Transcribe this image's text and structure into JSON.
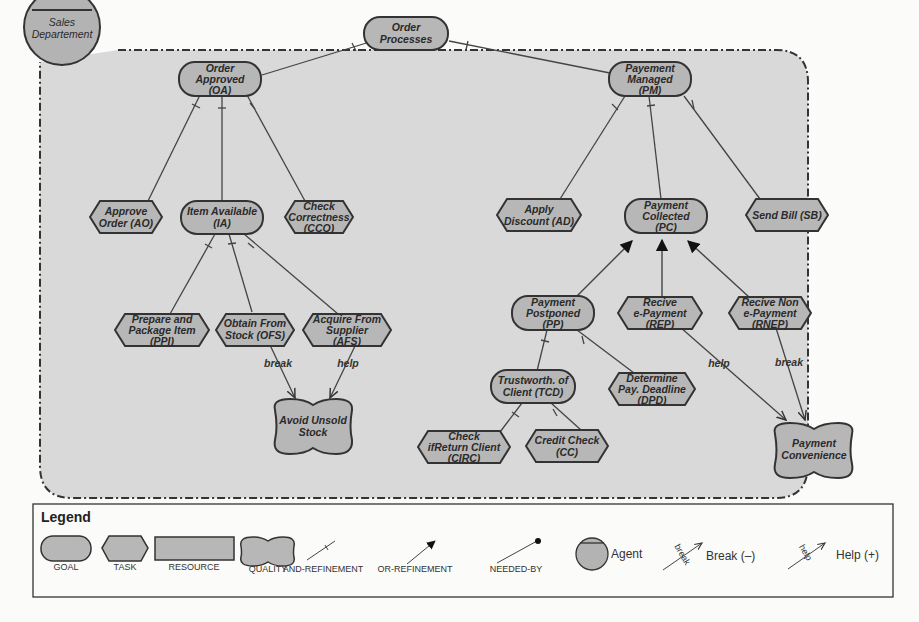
{
  "diagram": {
    "type": "iStar goal model",
    "agent": {
      "label_lines": [
        "Sales",
        "Departement"
      ]
    },
    "colors": {
      "node_fill": "#b7b7b7",
      "node_stroke": "#333333",
      "boundary_fill": "#d9d9d9",
      "background": "#fbfbfa"
    },
    "nodes": {
      "order_processes": {
        "type": "goal",
        "lines": [
          "Order",
          "Processes"
        ]
      },
      "oa": {
        "type": "goal",
        "lines": [
          "Order",
          "Approved",
          "(OA)"
        ]
      },
      "pm": {
        "type": "goal",
        "lines": [
          "Payement",
          "Managed",
          "(PM)"
        ]
      },
      "ao": {
        "type": "task",
        "lines": [
          "Approve",
          "Order (AO)"
        ]
      },
      "ia": {
        "type": "goal",
        "lines": [
          "Item Available",
          "(IA)"
        ]
      },
      "cco": {
        "type": "task",
        "lines": [
          "Check",
          "Correctness",
          "(CCO)"
        ]
      },
      "ad": {
        "type": "task",
        "lines": [
          "Apply",
          "Discount (AD)"
        ]
      },
      "pc": {
        "type": "goal",
        "lines": [
          "Payment",
          "Collected",
          "(PC)"
        ]
      },
      "sb": {
        "type": "task",
        "lines": [
          "Send Bill (SB)"
        ]
      },
      "ppi": {
        "type": "task",
        "lines": [
          "Prepare and",
          "Package Item",
          "(PPI)"
        ]
      },
      "ofs": {
        "type": "task",
        "lines": [
          "Obtain From",
          "Stock (OFS)"
        ]
      },
      "afs": {
        "type": "task",
        "lines": [
          "Acquire From",
          "Supplier",
          "(AFS)"
        ]
      },
      "aus": {
        "type": "quality",
        "lines": [
          "Avoid Unsold",
          "Stock"
        ]
      },
      "pp": {
        "type": "goal",
        "lines": [
          "Payment",
          "Postponed",
          "(PP)"
        ]
      },
      "rep": {
        "type": "task",
        "lines": [
          "Recive",
          "e-Payment",
          "(REP)"
        ]
      },
      "rnep": {
        "type": "task",
        "lines": [
          "Recive Non",
          "e-Payment",
          "(RNEP)"
        ]
      },
      "tcd": {
        "type": "goal",
        "lines": [
          "Trustworth. of",
          "Client (TCD)"
        ]
      },
      "dpd": {
        "type": "task",
        "lines": [
          "Determine",
          "Pay. Deadline",
          "(DPD)"
        ]
      },
      "circ": {
        "type": "task",
        "lines": [
          "Check",
          "ifReturn Client",
          "(CIRC)"
        ]
      },
      "cc": {
        "type": "task",
        "lines": [
          "Credit Check",
          "(CC)"
        ]
      },
      "pcv": {
        "type": "quality",
        "lines": [
          "Payment",
          "Convenience"
        ]
      }
    },
    "contributions": {
      "ofs_aus": "break",
      "afs_aus": "help",
      "rep_pcv": "help",
      "rnep_pcv": "break"
    }
  },
  "legend": {
    "title": "Legend",
    "items": {
      "goal": "GOAL",
      "task": "TASK",
      "resource": "RESOURCE",
      "quality": "QUALITY",
      "and_refinement": "AND-REFINEMENT",
      "or_refinement": "OR-REFINEMENT",
      "needed_by": "NEEDED-BY",
      "agent": "Agent",
      "break": "Break (–)",
      "help": "Help (+)",
      "break_tag": "break",
      "help_tag": "help"
    }
  }
}
